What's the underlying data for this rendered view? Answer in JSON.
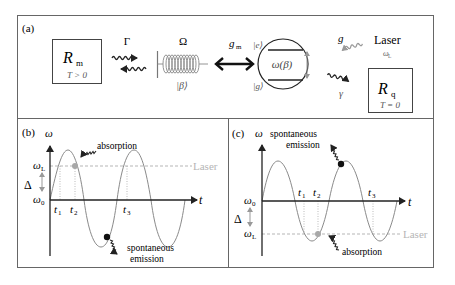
{
  "panels": {
    "a": {
      "label": "(a)",
      "reservoir_m": {
        "symbol": "R",
        "subscript": "m",
        "condition": "T > 0"
      },
      "gamma_rate": "Γ",
      "oscillator": {
        "frequency": "Ω",
        "state": "|β⟩"
      },
      "coupling": {
        "symbol": "g",
        "subscript": "m"
      },
      "qubit": {
        "excited": "|e⟩",
        "ground": "|g⟩",
        "transition": "ω(β)"
      },
      "drive": {
        "symbol": "g"
      },
      "laser": {
        "label": "Laser",
        "freq_symbol": "ω",
        "freq_sub": "L"
      },
      "decay": {
        "symbol": "γ"
      },
      "reservoir_q": {
        "symbol": "R",
        "subscript": "q",
        "condition": "T = 0"
      }
    },
    "b": {
      "label": "(b)",
      "y_axis": "ω",
      "x_axis": "t",
      "omega_L": {
        "symbol": "ω",
        "sub": "L"
      },
      "omega_0": {
        "symbol": "ω",
        "sub": "0"
      },
      "delta": "Δ",
      "t1": {
        "symbol": "t",
        "sub": "1"
      },
      "t2": {
        "symbol": "t",
        "sub": "2"
      },
      "t3": {
        "symbol": "t",
        "sub": "3"
      },
      "laser_label": "Laser",
      "absorption_label": "absorption",
      "emission_label_1": "spontaneous",
      "emission_label_2": "emission"
    },
    "c": {
      "label": "(c)",
      "y_axis": "ω",
      "x_axis": "t",
      "omega_L": {
        "symbol": "ω",
        "sub": "L"
      },
      "omega_0": {
        "symbol": "ω",
        "sub": "0"
      },
      "delta": "Δ",
      "t1": {
        "symbol": "t",
        "sub": "1"
      },
      "t2": {
        "symbol": "t",
        "sub": "2"
      },
      "t3": {
        "symbol": "t",
        "sub": "3"
      },
      "laser_label": "Laser",
      "absorption_label": "absorption",
      "emission_label_1": "spontaneous",
      "emission_label_2": "emission"
    }
  },
  "colors": {
    "frame": "#666666",
    "ink": "#222222",
    "wave": "#8a8a8a",
    "laser": "#b0b0b0",
    "absorption_dot": "#a8a8a8",
    "emission_dot": "#111111"
  }
}
